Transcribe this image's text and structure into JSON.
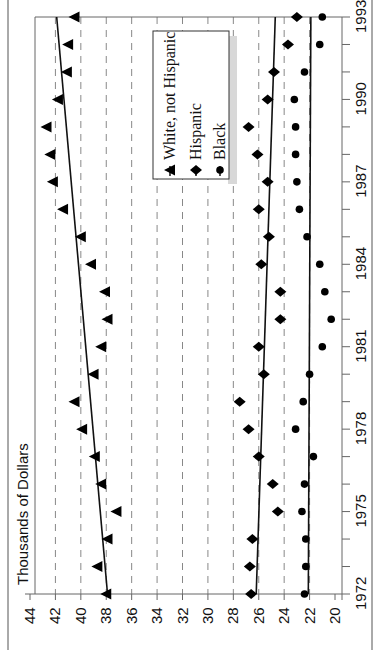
{
  "chart_data": {
    "type": "scatter",
    "orientation": "rotated-90-ccw",
    "title": "",
    "ylabel": "Thousands of Dollars",
    "xlabel": "",
    "x_ticks": [
      "1972",
      "1975",
      "1978",
      "1981",
      "1984",
      "1987",
      "1990",
      "1993"
    ],
    "y_ticks": [
      "20",
      "22",
      "24",
      "26",
      "28",
      "30",
      "32",
      "34",
      "36",
      "38",
      "40",
      "42",
      "44"
    ],
    "xlim": [
      1972,
      1993
    ],
    "ylim": [
      20,
      44
    ],
    "grid": "dashed horizontal at each y tick",
    "legend_position": "top-center",
    "x": [
      1972,
      1973,
      1974,
      1975,
      1976,
      1977,
      1978,
      1979,
      1980,
      1981,
      1982,
      1983,
      1984,
      1985,
      1986,
      1987,
      1988,
      1989,
      1990,
      1991,
      1992,
      1993
    ],
    "series": [
      {
        "name": "White, not Hispanic",
        "marker": "triangle",
        "values": [
          38.0,
          38.7,
          37.9,
          37.2,
          38.4,
          38.9,
          39.9,
          40.5,
          39.0,
          38.4,
          37.9,
          38.1,
          39.2,
          40.0,
          41.4,
          42.2,
          42.4,
          42.7,
          41.8,
          41.1,
          41.0,
          40.5
        ],
        "trend": [
          37.9,
          41.9
        ]
      },
      {
        "name": "Hispanic",
        "marker": "diamond",
        "values": [
          26.6,
          26.7,
          26.5,
          24.5,
          24.9,
          26.0,
          26.8,
          27.5,
          25.6,
          26.0,
          24.3,
          24.3,
          25.8,
          25.2,
          26.0,
          25.3,
          26.1,
          26.8,
          25.3,
          24.8,
          23.7,
          23.0
        ],
        "trend": [
          26.2,
          24.7
        ]
      },
      {
        "name": "Black",
        "marker": "circle",
        "values": [
          22.4,
          22.3,
          22.3,
          22.6,
          22.4,
          21.7,
          23.1,
          22.5,
          22.0,
          21.0,
          20.3,
          20.8,
          21.2,
          22.2,
          22.8,
          23.0,
          23.1,
          23.1,
          23.2,
          22.4,
          21.2,
          21.0
        ],
        "trend": [
          22.1,
          21.9
        ]
      }
    ]
  }
}
